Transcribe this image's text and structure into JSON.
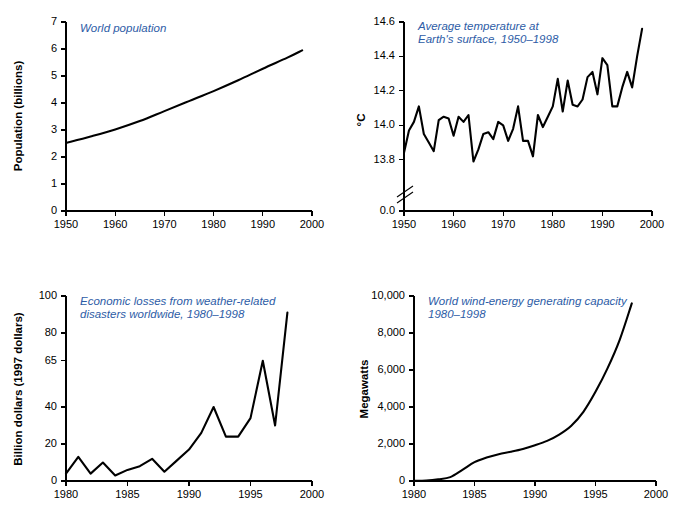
{
  "figure": {
    "background": "#ffffff",
    "title_color": "#2d5ca6",
    "line_color": "#000000"
  },
  "chart_data": [
    {
      "id": "population",
      "type": "line",
      "title": "World population",
      "title_lines": [
        "World population"
      ],
      "xlabel": "",
      "ylabel": "Population (billions)",
      "xlim": [
        1950,
        2000
      ],
      "ylim": [
        0,
        7
      ],
      "xticks": [
        1950,
        1960,
        1970,
        1980,
        1990,
        2000
      ],
      "xticklabels": [
        "1950",
        "1960",
        "1970",
        "1980",
        "1990",
        "2000"
      ],
      "yticks": [
        0,
        1,
        2,
        3,
        4,
        5,
        6,
        7
      ],
      "yticklabels": [
        "0",
        "1",
        "2",
        "3",
        "4",
        "5",
        "6",
        "7"
      ],
      "grid": false,
      "axis_break": false,
      "x": [
        1950,
        1955,
        1960,
        1965,
        1970,
        1975,
        1980,
        1985,
        1990,
        1995,
        1998
      ],
      "values": [
        2.52,
        2.76,
        3.02,
        3.33,
        3.7,
        4.07,
        4.44,
        4.84,
        5.27,
        5.68,
        5.95
      ]
    },
    {
      "id": "temperature",
      "type": "line",
      "title": "Average temperature at Earth's surface, 1950-1998",
      "title_lines": [
        "Average temperature at",
        "Earth's surface, 1950–1998"
      ],
      "xlabel": "",
      "ylabel": "°C",
      "xlim": [
        1950,
        2000
      ],
      "ylim": [
        13.7,
        14.6
      ],
      "xticks": [
        1950,
        1960,
        1970,
        1980,
        1990,
        2000
      ],
      "xticklabels": [
        "1950",
        "1960",
        "1970",
        "1980",
        "1990",
        "2000"
      ],
      "yticks": [
        13.8,
        14.0,
        14.2,
        14.4,
        14.6
      ],
      "yticklabels": [
        "13.8",
        "14.0",
        "14.2",
        "14.4",
        "14.6"
      ],
      "zero_tick_label": "0.0",
      "grid": false,
      "axis_break": true,
      "x": [
        1950,
        1951,
        1952,
        1953,
        1954,
        1955,
        1956,
        1957,
        1958,
        1959,
        1960,
        1961,
        1962,
        1963,
        1964,
        1965,
        1966,
        1967,
        1968,
        1969,
        1970,
        1971,
        1972,
        1973,
        1974,
        1975,
        1976,
        1977,
        1978,
        1979,
        1980,
        1981,
        1982,
        1983,
        1984,
        1985,
        1986,
        1987,
        1988,
        1989,
        1990,
        1991,
        1992,
        1993,
        1994,
        1995,
        1996,
        1997,
        1998
      ],
      "values": [
        13.84,
        13.97,
        14.02,
        14.11,
        13.95,
        13.9,
        13.85,
        14.03,
        14.05,
        14.04,
        13.94,
        14.05,
        14.02,
        14.06,
        13.79,
        13.86,
        13.95,
        13.96,
        13.92,
        14.02,
        14.0,
        13.91,
        13.98,
        14.11,
        13.91,
        13.91,
        13.82,
        14.06,
        13.99,
        14.05,
        14.11,
        14.27,
        14.08,
        14.26,
        14.12,
        14.11,
        14.15,
        14.28,
        14.31,
        14.18,
        14.39,
        14.35,
        14.11,
        14.11,
        14.22,
        14.31,
        14.22,
        14.4,
        14.56
      ]
    },
    {
      "id": "losses",
      "type": "line",
      "title": "Economic losses from weather-related disasters worldwide, 1980-1998",
      "title_lines": [
        "Economic losses from weather-related",
        "disasters worldwide, 1980–1998"
      ],
      "xlabel": "",
      "ylabel": "Billion dollars (1997 dollars)",
      "xlim": [
        1980,
        2000
      ],
      "ylim": [
        0,
        100
      ],
      "xticks": [
        1980,
        1985,
        1990,
        1995,
        2000
      ],
      "xticklabels": [
        "1980",
        "1985",
        "1990",
        "1995",
        "2000"
      ],
      "yticks": [
        0,
        20,
        40,
        65,
        80,
        100
      ],
      "yticklabels": [
        "0",
        "20",
        "40",
        "65",
        "80",
        "100"
      ],
      "grid": false,
      "axis_break": false,
      "x": [
        1980,
        1981,
        1982,
        1983,
        1984,
        1985,
        1986,
        1987,
        1988,
        1989,
        1990,
        1991,
        1992,
        1993,
        1994,
        1995,
        1996,
        1997,
        1998
      ],
      "values": [
        4,
        13,
        4,
        10,
        3,
        6,
        8,
        12,
        5,
        11,
        17,
        26,
        40,
        24,
        24,
        34,
        65,
        30,
        91
      ]
    },
    {
      "id": "wind",
      "type": "line",
      "title": "World wind-energy generating capacity 1980-1998",
      "title_lines": [
        "World wind-energy generating capacity",
        "1980–1998"
      ],
      "xlabel": "",
      "ylabel": "Megawatts",
      "xlim": [
        1980,
        2000
      ],
      "ylim": [
        0,
        10000
      ],
      "xticks": [
        1980,
        1985,
        1990,
        1995,
        2000
      ],
      "xticklabels": [
        "1980",
        "1985",
        "1990",
        "1995",
        "2000"
      ],
      "yticks": [
        0,
        2000,
        4000,
        6000,
        8000,
        10000
      ],
      "yticklabels": [
        "0",
        "2,000",
        "4,000",
        "6,000",
        "8,000",
        "10,000"
      ],
      "grid": false,
      "axis_break": false,
      "x": [
        1980,
        1981,
        1982,
        1983,
        1984,
        1985,
        1986,
        1987,
        1988,
        1989,
        1990,
        1991,
        1992,
        1993,
        1994,
        1995,
        1996,
        1997,
        1998
      ],
      "values": [
        10,
        25,
        90,
        210,
        600,
        1020,
        1270,
        1450,
        1580,
        1730,
        1930,
        2170,
        2510,
        2990,
        3740,
        4820,
        6100,
        7630,
        9600
      ]
    }
  ]
}
